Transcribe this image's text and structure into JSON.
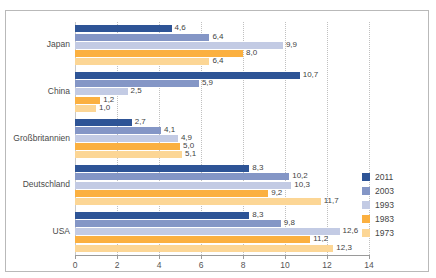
{
  "title": "",
  "chart_data": {
    "type": "bar",
    "orientation": "horizontal",
    "title": "",
    "xlabel": "",
    "ylabel": "",
    "xlim": [
      0,
      14
    ],
    "xticks": [
      0,
      2,
      4,
      6,
      8,
      10,
      12,
      14
    ],
    "xtick_labels": [
      "0",
      "2",
      "4",
      "6",
      "8",
      "10",
      "12",
      "14"
    ],
    "grid": "vertical-dotted",
    "legend_position": "right",
    "decimal_separator": ",",
    "categories": [
      "Japan",
      "China",
      "Großbritannien",
      "Deutschland",
      "USA"
    ],
    "series": [
      {
        "name": "2011",
        "color": "#2e5496",
        "values": [
          4.6,
          10.7,
          2.7,
          8.3,
          8.3
        ],
        "labels": [
          "4,6",
          "10,7",
          "2,7",
          "8,3",
          "8,3"
        ]
      },
      {
        "name": "2003",
        "color": "#8496c6",
        "values": [
          6.4,
          5.9,
          4.1,
          10.2,
          9.8
        ],
        "labels": [
          "6,4",
          "5,9",
          "4,1",
          "10,2",
          "9,8"
        ]
      },
      {
        "name": "1993",
        "color": "#c3cbe4",
        "values": [
          9.9,
          2.5,
          4.9,
          10.3,
          12.6
        ],
        "labels": [
          "9,9",
          "2,5",
          "4,9",
          "10,3",
          "12,6"
        ]
      },
      {
        "name": "1983",
        "color": "#fbb040",
        "values": [
          8.0,
          1.2,
          5.0,
          9.2,
          11.2
        ],
        "labels": [
          "8,0",
          "1,2",
          "5,0",
          "9,2",
          "11,2"
        ]
      },
      {
        "name": "1973",
        "color": "#fcd695",
        "values": [
          6.4,
          1.0,
          5.1,
          11.7,
          12.3
        ],
        "labels": [
          "6,4",
          "1,0",
          "5,1",
          "11,7",
          "12,3"
        ]
      }
    ]
  },
  "legend": {
    "items": [
      {
        "label": "2011",
        "color": "#2e5496"
      },
      {
        "label": "2003",
        "color": "#8496c6"
      },
      {
        "label": "1993",
        "color": "#c3cbe4"
      },
      {
        "label": "1983",
        "color": "#fbb040"
      },
      {
        "label": "1973",
        "color": "#fcd695"
      }
    ]
  }
}
